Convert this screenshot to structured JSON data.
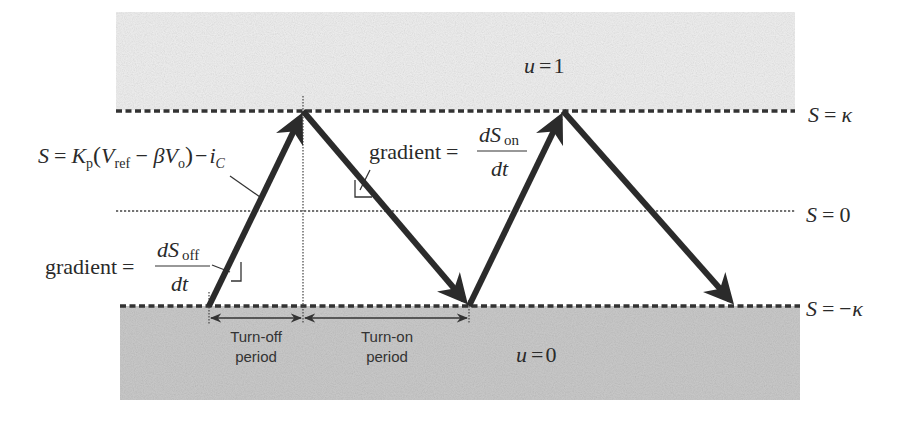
{
  "diagram": {
    "type": "sliding-mode hysteresis switching diagram",
    "regions": {
      "upper": {
        "label_var": "u",
        "label_eq": "=",
        "label_val": "1",
        "color": "#eeeeee"
      },
      "lower": {
        "label_var": "u",
        "label_eq": "=",
        "label_val": "0",
        "color": "#c9c9c9"
      }
    },
    "levels": {
      "upper": {
        "S": "S",
        "eq": "=",
        "value": "κ"
      },
      "zero": {
        "S": "S",
        "eq": "=",
        "value": "0"
      },
      "lower": {
        "S": "S",
        "eq": "=",
        "value": "−κ"
      }
    },
    "sliding_surface": {
      "lhs": "S",
      "eq": "=",
      "K": "K",
      "K_sub": "p",
      "open": "(",
      "V1": "V",
      "V1_sub": "ref",
      "minus": " − ",
      "beta": "β",
      "V2": "V",
      "V2_sub": "o",
      "close": ")",
      "minus2": "−",
      "i": "i",
      "i_sub": "C"
    },
    "gradient_off": {
      "word": "gradient",
      "eq": "=",
      "num_d": "d",
      "num_S": "S",
      "num_sub": "off",
      "den": "dt"
    },
    "gradient_on": {
      "word": "gradient",
      "eq": "=",
      "num_d": "d",
      "num_S": "S",
      "num_sub": "on",
      "den": "dt"
    },
    "periods": {
      "off": {
        "line1": "Turn-off",
        "line2": "period"
      },
      "on": {
        "line1": "Turn-on",
        "line2": "period"
      }
    },
    "trajectory_points": [
      [
        209,
        306
      ],
      [
        303,
        111
      ],
      [
        469,
        306
      ],
      [
        563,
        111
      ],
      [
        735,
        306
      ]
    ],
    "colors": {
      "stroke": "#2b2b2b",
      "dashed": "#333333",
      "text": "#2a2a2a"
    }
  }
}
